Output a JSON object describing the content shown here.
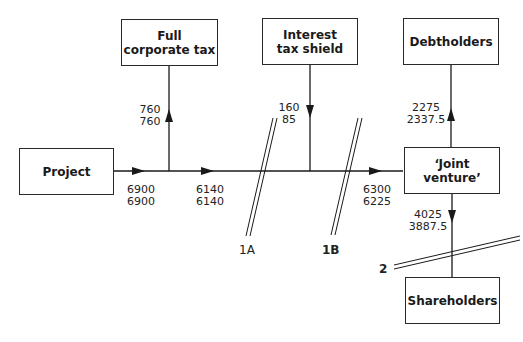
{
  "nodes": {
    "project": "Project",
    "full_tax_line1": "Full",
    "full_tax_line2": "corporate tax",
    "its_line1": "Interest",
    "its_line2": "tax shield",
    "debtholders": "Debtholders",
    "jv": "‘Joint venture’",
    "shareholders": "Shareholders"
  },
  "flows": {
    "project_out": {
      "a": "6900",
      "b": "6900"
    },
    "full_tax": {
      "a": "760",
      "b": "760"
    },
    "after_tax": {
      "a": "6140",
      "b": "6140"
    },
    "its": {
      "a": "160",
      "b": "85"
    },
    "jv_in": {
      "a": "6300",
      "b": "6225"
    },
    "debt": {
      "a": "2275",
      "b": "2337.5"
    },
    "equity": {
      "a": "4025",
      "b": "3887.5"
    }
  },
  "cuts": {
    "c1a": "1A",
    "c1b": "1B",
    "c2": "2"
  }
}
